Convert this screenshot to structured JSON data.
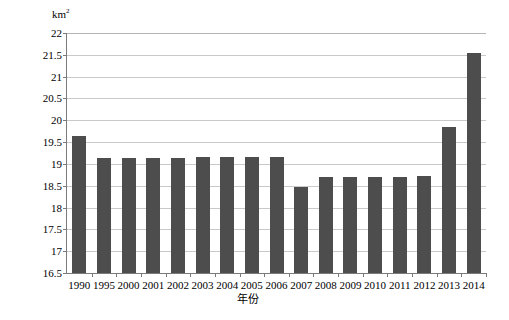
{
  "chart_data": {
    "type": "bar",
    "title": "",
    "subtitle": "",
    "xlabel": "年份",
    "ylabel": "km²",
    "ylabel_base": "km",
    "ylabel_sup": "2",
    "categories": [
      "1990",
      "1995",
      "2000",
      "2001",
      "2002",
      "2003",
      "2004",
      "2005",
      "2006",
      "2007",
      "2008",
      "2009",
      "2010",
      "2011",
      "2012",
      "2013",
      "2014"
    ],
    "values": [
      19.63,
      19.14,
      19.14,
      19.14,
      19.14,
      19.15,
      19.15,
      19.15,
      19.16,
      18.48,
      18.71,
      18.71,
      18.71,
      18.71,
      18.72,
      19.84,
      21.55
    ],
    "series": [
      {
        "name": "面积",
        "values": [
          19.63,
          19.14,
          19.14,
          19.14,
          19.14,
          19.15,
          19.15,
          19.15,
          19.16,
          18.48,
          18.71,
          18.71,
          18.71,
          18.71,
          18.72,
          19.84,
          21.55
        ]
      }
    ],
    "ylim": [
      16.5,
      22
    ],
    "ytick_values": [
      16.5,
      17,
      17.5,
      18,
      18.5,
      19,
      19.5,
      20,
      20.5,
      21,
      21.5,
      22
    ],
    "ytick_labels": [
      "16.5",
      "17",
      "17.5",
      "18",
      "18.5",
      "19",
      "19.5",
      "20",
      "20.5",
      "21",
      "21.5",
      "22"
    ],
    "grid": true,
    "grid_axis": "y",
    "legend": false,
    "legend_position": "none",
    "bar_color": "#4d4d4d",
    "grid_color": "#c9c9c9",
    "axis_color": "#7a7a7a",
    "background_color": "#ffffff",
    "annotations": []
  }
}
